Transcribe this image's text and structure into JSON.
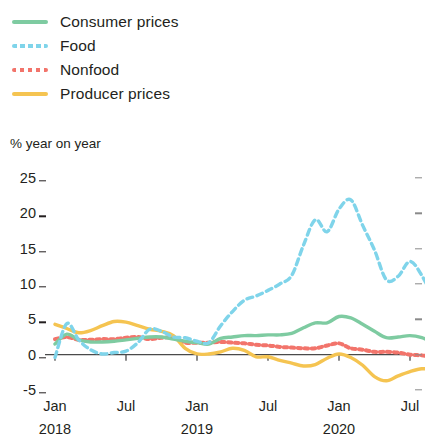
{
  "legend": {
    "items": [
      {
        "label": "Consumer prices",
        "color": "#7ecba1",
        "style": "solid",
        "swatch_name": "legend-swatch-consumer-prices"
      },
      {
        "label": "Food",
        "color": "#7fd4ea",
        "style": "dashed",
        "swatch_name": "legend-swatch-food"
      },
      {
        "label": "Nonfood",
        "color": "#f2746b",
        "style": "dotted",
        "swatch_name": "legend-swatch-nonfood"
      },
      {
        "label": "Producer prices",
        "color": "#f5c council",
        "style": "solid",
        "swatch_name": "legend-swatch-producer-prices"
      }
    ]
  },
  "axis": {
    "unit_caption": "% year on year",
    "y_ticks": [
      "25",
      "20",
      "15",
      "10",
      "5",
      "0",
      "-5"
    ],
    "y_values": [
      25,
      20,
      15,
      10,
      5,
      0,
      -5
    ],
    "x_ticks": [
      {
        "label": "Jan",
        "year": "2018"
      },
      {
        "label": "Jul",
        "year": ""
      },
      {
        "label": "Jan",
        "year": "2019"
      },
      {
        "label": "Jul",
        "year": ""
      },
      {
        "label": "Jan",
        "year": "2020"
      },
      {
        "label": "Jul",
        "year": ""
      }
    ]
  },
  "chart_data": {
    "type": "line",
    "title": "",
    "subtitle": "",
    "xlabel": "",
    "ylabel": "% year on year",
    "ylim": [
      -5,
      25
    ],
    "grid": false,
    "legend_position": "top-left",
    "x": [
      "2018-01",
      "2018-02",
      "2018-03",
      "2018-04",
      "2018-05",
      "2018-06",
      "2018-07",
      "2018-08",
      "2018-09",
      "2018-10",
      "2018-11",
      "2018-12",
      "2019-01",
      "2019-02",
      "2019-03",
      "2019-04",
      "2019-05",
      "2019-06",
      "2019-07",
      "2019-08",
      "2019-09",
      "2019-10",
      "2019-11",
      "2019-12",
      "2020-01",
      "2020-02",
      "2020-03",
      "2020-04",
      "2020-05",
      "2020-06",
      "2020-07",
      "2020-08",
      "2020-09"
    ],
    "x_tick_labels": [
      "Jan 2018",
      "Jul",
      "Jan 2019",
      "Jul",
      "Jan 2020",
      "Jul"
    ],
    "series": [
      {
        "name": "Consumer prices",
        "color": "#7ecba1",
        "style": "solid",
        "values": [
          1.5,
          2.9,
          2.1,
          1.8,
          1.8,
          1.9,
          2.1,
          2.3,
          2.5,
          2.5,
          2.2,
          1.9,
          1.7,
          1.5,
          2.3,
          2.5,
          2.7,
          2.7,
          2.8,
          2.8,
          3.0,
          3.8,
          4.5,
          4.5,
          5.4,
          5.2,
          4.3,
          3.3,
          2.4,
          2.5,
          2.7,
          2.4,
          1.7
        ]
      },
      {
        "name": "Food",
        "color": "#7fd4ea",
        "style": "dashed",
        "values": [
          -0.4,
          4.4,
          2.1,
          0.7,
          0.1,
          0.3,
          0.5,
          1.7,
          3.6,
          3.3,
          2.5,
          2.4,
          1.9,
          1.7,
          4.1,
          6.1,
          7.7,
          8.3,
          9.1,
          10.0,
          11.2,
          15.5,
          19.1,
          17.4,
          20.6,
          21.9,
          18.3,
          14.8,
          10.6,
          11.1,
          13.2,
          11.2,
          7.9
        ]
      },
      {
        "name": "Nonfood",
        "color": "#f2746b",
        "style": "dotted",
        "values": [
          2.2,
          2.5,
          2.1,
          2.1,
          2.2,
          2.2,
          2.4,
          2.5,
          2.2,
          2.4,
          2.4,
          1.7,
          1.7,
          1.7,
          1.8,
          1.7,
          1.6,
          1.4,
          1.3,
          1.1,
          1.0,
          0.9,
          0.9,
          1.3,
          1.6,
          0.9,
          0.7,
          0.4,
          0.4,
          0.3,
          0.0,
          -0.1,
          -0.3
        ]
      },
      {
        "name": "Producer prices",
        "color": "#f5c451",
        "style": "solid",
        "values": [
          4.3,
          3.7,
          3.1,
          3.4,
          4.1,
          4.7,
          4.6,
          4.1,
          3.6,
          3.3,
          2.7,
          0.9,
          0.1,
          0.1,
          0.4,
          0.9,
          0.6,
          -0.3,
          -0.3,
          -0.8,
          -1.2,
          -1.6,
          -1.4,
          -0.5,
          0.1,
          -0.4,
          -1.5,
          -3.1,
          -3.7,
          -3.0,
          -2.4,
          -2.0,
          -2.1
        ]
      }
    ]
  }
}
